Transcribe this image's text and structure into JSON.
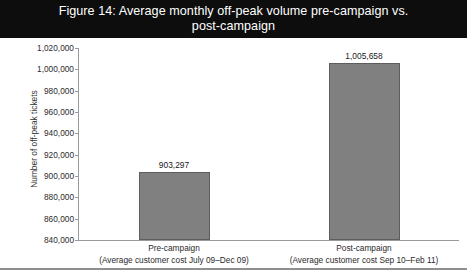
{
  "figure": {
    "title": "Figure 14: Average monthly off-peak volume pre-campaign vs. post-campaign",
    "title_bar_color": "#0d0d0d",
    "title_text_color": "#ffffff"
  },
  "chart_data": {
    "type": "bar",
    "title": "Figure 14: Average monthly off-peak volume pre-campaign vs. post-campaign",
    "xlabel": "",
    "ylabel": "Number of off-peak tickets",
    "ylim": [
      840000,
      1020000
    ],
    "ytick_step": 20000,
    "grid": false,
    "legend": false,
    "bar_color": "#808080",
    "bar_border_color": "#5d5d5d",
    "categories": [
      "Pre-campaign\n(Average customer cost July 09–Dec 09)",
      "Post-campaign\n(Average customer cost Sep 10–Feb 11)"
    ],
    "category_lines": [
      {
        "line1": "Pre-campaign",
        "line2": "(Average customer cost July 09–Dec 09)"
      },
      {
        "line1": "Post-campaign",
        "line2": "(Average customer cost Sep 10–Feb 11)"
      }
    ],
    "values": [
      903297,
      1005658
    ],
    "value_labels": [
      "903,297",
      "1,005,658"
    ],
    "ytick_labels": [
      "1,020,000",
      "1,000,000",
      "980,000",
      "960,000",
      "940,000",
      "920,000",
      "900,000",
      "880,000",
      "860,000",
      "840,000"
    ],
    "yticks": [
      1020000,
      1000000,
      980000,
      960000,
      940000,
      920000,
      900000,
      880000,
      860000,
      840000
    ]
  }
}
